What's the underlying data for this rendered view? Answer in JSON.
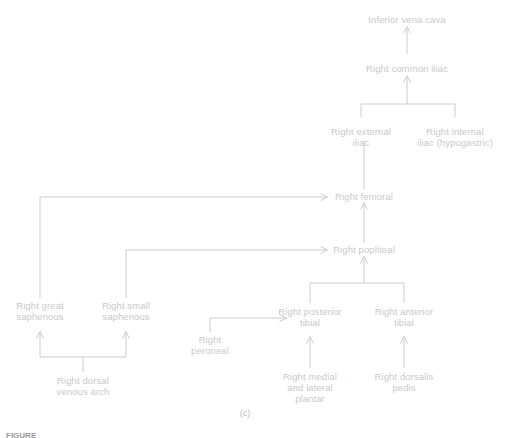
{
  "figure": {
    "panel_label": "(c)",
    "caption_prefix": "FIGURE",
    "caption_rest": "",
    "line_color": "#cccccc",
    "text_color": "#c9c9c9"
  },
  "nodes": [
    {
      "id": "inferior-vena-cava",
      "label": "Inferior vena cava",
      "x": 407,
      "y": 14
    },
    {
      "id": "right-common-iliac",
      "label": "Right common iliac",
      "x": 407,
      "y": 63
    },
    {
      "id": "right-external-iliac",
      "label": "Right external\niliac",
      "x": 361,
      "y": 126
    },
    {
      "id": "right-internal-iliac",
      "label": "Right internal\niliac (hypogastric)",
      "x": 455,
      "y": 126
    },
    {
      "id": "right-femoral",
      "label": "Right femoral",
      "x": 364,
      "y": 196
    },
    {
      "id": "right-popliteal",
      "label": "Right popliteal",
      "x": 364,
      "y": 249
    },
    {
      "id": "right-great-saphenous",
      "label": "Right great\nsaphenous",
      "x": 40,
      "y": 306
    },
    {
      "id": "right-small-saphenous",
      "label": "Right small\nsaphenous",
      "x": 126,
      "y": 306
    },
    {
      "id": "right-posterior-tibial",
      "label": "Right posterior\ntibial",
      "x": 310,
      "y": 312
    },
    {
      "id": "right-anterior-tibial",
      "label": "Right anterior\ntibial",
      "x": 404,
      "y": 312
    },
    {
      "id": "right-peroneal",
      "label": "Right\nperoneal",
      "x": 210,
      "y": 338
    },
    {
      "id": "right-dorsal-venous-arch",
      "label": "Right dorsal\nvenous arch",
      "x": 83,
      "y": 381
    },
    {
      "id": "right-medial-lateral-plantar",
      "label": "Right medial\nand lateral\nplantar",
      "x": 310,
      "y": 375
    },
    {
      "id": "right-dorsalis-pedis",
      "label": "Right dorsalis\npedis",
      "x": 404,
      "y": 375
    }
  ],
  "connections": [
    {
      "from": "right-common-iliac",
      "to": "inferior-vena-cava",
      "type": "arrow-up"
    },
    {
      "from": "iliac-bifurcation",
      "to": "right-common-iliac",
      "type": "arrow-up"
    },
    {
      "from": "right-external-iliac",
      "to": "iliac-bifurcation",
      "type": "line"
    },
    {
      "from": "right-internal-iliac",
      "to": "iliac-bifurcation",
      "type": "line"
    },
    {
      "from": "right-femoral",
      "to": "right-external-iliac",
      "type": "line"
    },
    {
      "from": "right-popliteal",
      "to": "right-femoral",
      "type": "arrow-up"
    },
    {
      "from": "right-great-saphenous",
      "to": "right-femoral",
      "type": "arrow-right"
    },
    {
      "from": "right-small-saphenous",
      "to": "right-popliteal",
      "type": "arrow-right"
    },
    {
      "from": "tibial-junction",
      "to": "right-popliteal",
      "type": "arrow-up"
    },
    {
      "from": "right-posterior-tibial",
      "to": "tibial-junction",
      "type": "line"
    },
    {
      "from": "right-anterior-tibial",
      "to": "tibial-junction",
      "type": "line"
    },
    {
      "from": "right-peroneal",
      "to": "right-posterior-tibial",
      "type": "arrow-right"
    },
    {
      "from": "right-medial-lateral-plantar",
      "to": "right-posterior-tibial",
      "type": "arrow-up"
    },
    {
      "from": "right-dorsalis-pedis",
      "to": "right-anterior-tibial",
      "type": "arrow-up"
    },
    {
      "from": "right-dorsal-venous-arch",
      "to": "right-great-saphenous",
      "type": "arrow-up"
    },
    {
      "from": "right-dorsal-venous-arch",
      "to": "right-small-saphenous",
      "type": "arrow-up"
    }
  ]
}
